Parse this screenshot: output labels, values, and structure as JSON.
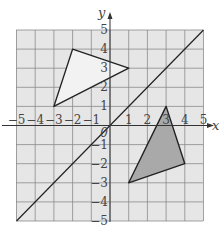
{
  "diagram": {
    "type": "coordinate-grid",
    "x_range": [
      -5,
      5
    ],
    "y_range": [
      -5,
      5
    ],
    "axis_labels": {
      "x": "x",
      "y": "y"
    },
    "x_ticks": [
      "-5",
      "-4",
      "-3",
      "-2",
      "-1",
      "0",
      "1",
      "2",
      "3",
      "4",
      "5"
    ],
    "y_ticks": [
      "5",
      "4",
      "3",
      "2",
      "1",
      "-1",
      "-2",
      "-3",
      "-4",
      "-5"
    ],
    "origin_label": "0",
    "line": {
      "from": [
        -5,
        -5
      ],
      "to": [
        5,
        5
      ],
      "label": "y = x"
    },
    "shapes": [
      {
        "name": "triangle-unshaded",
        "vertices": [
          [
            -2,
            4
          ],
          [
            1,
            3
          ],
          [
            -3,
            1
          ]
        ],
        "fill": "#f2f2f2"
      },
      {
        "name": "triangle-shaded",
        "vertices": [
          [
            3,
            1
          ],
          [
            4,
            -2
          ],
          [
            1,
            -3
          ]
        ],
        "fill": "#a9a9a9"
      }
    ],
    "colors": {
      "grid_fill": "#e6e6e6",
      "grid_line": "#8a8a8a",
      "stroke": "#222222"
    }
  }
}
